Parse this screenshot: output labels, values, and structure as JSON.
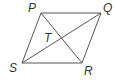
{
  "figure": {
    "type": "parallelogram-with-diagonals",
    "stroke_color": "#555555",
    "label_color": "#333333",
    "vertices": [
      {
        "name": "P",
        "x": 41,
        "y": 13,
        "label_x": 28,
        "label_y": 12
      },
      {
        "name": "Q",
        "x": 101,
        "y": 13,
        "label_x": 103,
        "label_y": 12
      },
      {
        "name": "R",
        "x": 82,
        "y": 63,
        "label_x": 84,
        "label_y": 75
      },
      {
        "name": "S",
        "x": 22,
        "y": 63,
        "label_x": 9,
        "label_y": 72
      }
    ],
    "diagonals": [
      {
        "from": "P",
        "to": "R"
      },
      {
        "from": "Q",
        "to": "S"
      }
    ],
    "intersection": {
      "name": "T",
      "x": 61.5,
      "y": 38,
      "label_x": 44,
      "label_y": 42
    },
    "labels": {
      "P": "P",
      "Q": "Q",
      "R": "R",
      "S": "S",
      "T": "T"
    }
  }
}
